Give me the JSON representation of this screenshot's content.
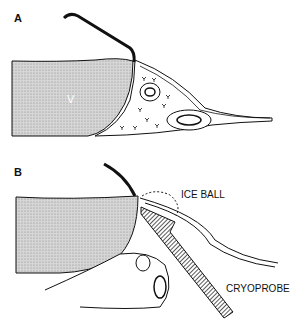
{
  "panels": [
    {
      "label": "A",
      "region_label": "V"
    },
    {
      "label": "B",
      "annotations": [
        "ICE BALL",
        "CRYOPROBE"
      ]
    }
  ],
  "colors": {
    "ink": "#111111",
    "stipple": "#cfcfcf",
    "background": "#ffffff"
  }
}
